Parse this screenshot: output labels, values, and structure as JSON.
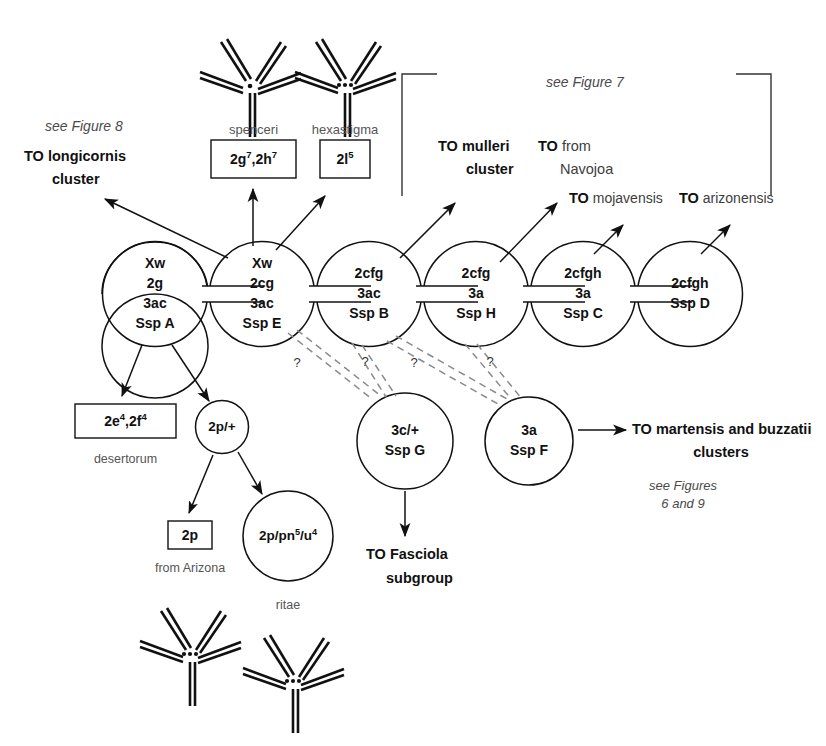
{
  "figure": {
    "background": "#ffffff",
    "ink": "#111111",
    "dashed_ink": "#8a8a8a"
  },
  "main_chain": [
    {
      "id": "A",
      "lines": [
        "Xw",
        "2g",
        "3ac",
        "Ssp A"
      ]
    },
    {
      "id": "E",
      "lines": [
        "Xw",
        "2cg",
        "3ac",
        "Ssp E"
      ]
    },
    {
      "id": "B",
      "lines": [
        "2cfg",
        "3ac",
        "Ssp B"
      ]
    },
    {
      "id": "H",
      "lines": [
        "2cfg",
        "3a",
        "Ssp H"
      ]
    },
    {
      "id": "C",
      "lines": [
        "2cfgh",
        "3a",
        "Ssp C"
      ]
    },
    {
      "id": "D",
      "lines": [
        "2cfgh",
        "Ssp D"
      ]
    }
  ],
  "lower_nodes": [
    {
      "id": "G",
      "lines": [
        "3c/+",
        "Ssp G"
      ]
    },
    {
      "id": "F",
      "lines": [
        "3a",
        "Ssp F"
      ]
    },
    {
      "id": "2p_plus",
      "lines": [
        "2p/+"
      ]
    },
    {
      "id": "ritae",
      "lines": [
        "2p/pn<sup>5</sup>/u<sup>4</sup>"
      ],
      "caption": "ritae"
    }
  ],
  "boxes": [
    {
      "id": "spenceri",
      "caption": "spenceri",
      "text": "2g<sup>7</sup>,2h<sup>7</sup>"
    },
    {
      "id": "hexastigma",
      "caption": "hexastigma",
      "text": "2l<sup>5</sup>"
    },
    {
      "id": "desertorum",
      "caption": "desertorum",
      "text": "2e<sup>4</sup>,2f<sup>4</sup>"
    },
    {
      "id": "arizona",
      "caption": "from Arizona",
      "text": "2p"
    }
  ],
  "destinations": {
    "longicornis": {
      "line1": "TO longicornis",
      "line2": "cluster"
    },
    "mulleri": {
      "line1": "TO mulleri",
      "line2": "cluster"
    },
    "navojoa": {
      "strong": "TO",
      "light": "from",
      "line2": "Navojoa"
    },
    "mojavensis": {
      "strong": "TO",
      "light": "mojavensis"
    },
    "arizonensis": {
      "strong": "TO",
      "light": "arizonensis"
    },
    "fasciola": {
      "line1": "TO Fasciola",
      "line2": "subgroup"
    },
    "martensis": {
      "line1": "TO martensis and buzzatii",
      "line2": "clusters"
    }
  },
  "cross_refs": {
    "fig8": "see Figure 8",
    "fig7": "see Figure 7",
    "fig69_line1": "see Figures",
    "fig69_line2": "6 and 9"
  },
  "uncertainty_marks": [
    {
      "id": "q1",
      "label": "?"
    },
    {
      "id": "q2",
      "label": "?"
    },
    {
      "id": "q3",
      "label": "?"
    },
    {
      "id": "q4",
      "label": "?"
    }
  ],
  "karyotypes": [
    {
      "id": "karyo-spenceri",
      "dots": 1
    },
    {
      "id": "karyo-hexastigma",
      "dots": 3
    },
    {
      "id": "karyo-arizona",
      "dots": 3
    },
    {
      "id": "karyo-ritae",
      "dots": 3
    }
  ]
}
